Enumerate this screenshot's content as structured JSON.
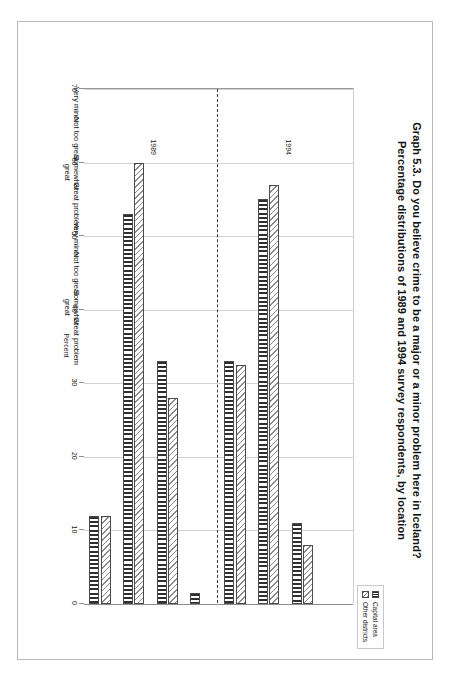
{
  "title": {
    "line1": "Graph 5.3.  Do you believe crime to be a major or a minor problem here in Iceland?",
    "line2": "Percentage distributions of 1989 and 1994 survey respondents, by location"
  },
  "legend": {
    "position": "top-right",
    "items": [
      {
        "label": "Capital area",
        "pattern": "vertical-lines",
        "color": "#2f2f2f"
      },
      {
        "label": "Other districts",
        "pattern": "diagonal-hatch",
        "color": "#8a8a8a"
      }
    ]
  },
  "annotations": [
    {
      "text": "1989",
      "group": "left"
    },
    {
      "text": "1994",
      "group": "right"
    }
  ],
  "chart_data": {
    "type": "bar",
    "orientation": "horizontal",
    "title": "Graph 5.3.  Do you believe crime to be a major or a minor problem here in Iceland? Percentage distributions of 1989 and 1994 survey respondents, by location",
    "xlabel": "",
    "ylabel": "Percent",
    "ylim": [
      0,
      70
    ],
    "yticks": [
      0,
      10,
      20,
      30,
      40,
      50,
      60,
      70
    ],
    "ytick_labels": [
      "0",
      "10",
      "20",
      "30",
      "40",
      "50",
      "60",
      "70"
    ],
    "grid": true,
    "legend_position": "top right",
    "group_separator": true,
    "groups": [
      "1989",
      "1994"
    ],
    "categories": [
      "Great problem",
      "Somewhat\ngreat",
      "Not too great",
      "Very minor",
      "Great problem",
      "Somewhat\ngreat",
      "Not too great",
      "Very minor"
    ],
    "category_groups": [
      "1989",
      "1989",
      "1989",
      "1989",
      "1994",
      "1994",
      "1994",
      "1994"
    ],
    "series": [
      {
        "name": "Capital area",
        "values": [
          12.0,
          53.0,
          33.0,
          1.5,
          33.0,
          55.0,
          11.0,
          0.0
        ]
      },
      {
        "name": "Other districts",
        "values": [
          12.0,
          60.0,
          28.0,
          0.0,
          32.5,
          57.0,
          8.0,
          0.0
        ]
      }
    ]
  }
}
